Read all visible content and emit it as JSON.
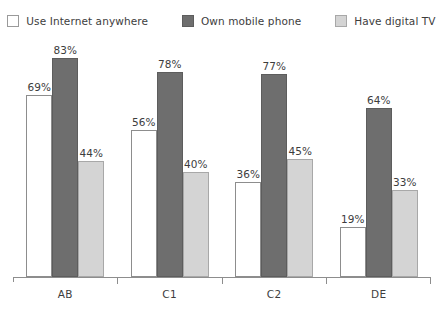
{
  "chart_data": {
    "type": "bar",
    "title": "",
    "subtitle": "",
    "xlabel": "",
    "ylabel": "",
    "ylim": [
      0,
      90
    ],
    "grid": false,
    "legend_position": "top-center",
    "value_suffix": "%",
    "categories": [
      "AB",
      "C1",
      "C2",
      "DE"
    ],
    "series": [
      {
        "name": "Use Internet anywhere",
        "color": "#ffffff",
        "border_color": "#8d8d8d",
        "values": [
          69,
          56,
          36,
          19
        ],
        "labels": [
          "69%",
          "56%",
          "36%",
          "19%"
        ]
      },
      {
        "name": "Own mobile phone",
        "color": "#6e6e6e",
        "border_color": "#5d5d5d",
        "values": [
          83,
          78,
          77,
          64
        ],
        "labels": [
          "83%",
          "78%",
          "77%",
          "64%"
        ]
      },
      {
        "name": "Have digital TV",
        "color": "#d4d4d4",
        "border_color": "#a8a8a8",
        "values": [
          44,
          40,
          45,
          33
        ],
        "labels": [
          "44%",
          "40%",
          "45%",
          "33%"
        ]
      }
    ]
  }
}
